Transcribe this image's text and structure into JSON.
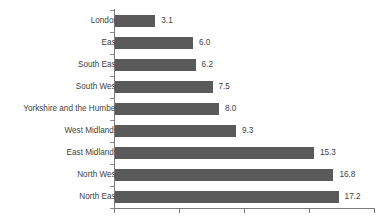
{
  "chart_data": {
    "type": "bar",
    "orientation": "horizontal",
    "title": "",
    "subtitle": "",
    "xlabel": "",
    "ylabel": "",
    "xlim": [
      0,
      20
    ],
    "grid": false,
    "legend": null,
    "x_tick_values": [
      0,
      5,
      10,
      15,
      20
    ],
    "x_tick_labels": [
      "",
      "",
      "",
      "",
      ""
    ],
    "categories": [
      "London",
      "East",
      "South East",
      "South West",
      "Yorkshire and the Humber",
      "West Midlands",
      "East Midlands",
      "North West",
      "North East"
    ],
    "values": [
      3.1,
      6.0,
      6.2,
      7.5,
      8.0,
      9.3,
      15.3,
      16.8,
      17.2
    ],
    "value_labels": [
      "3.1",
      "6.0",
      "6.2",
      "7.5",
      "8.0",
      "9.3",
      "15.3",
      "16.8",
      "17.2"
    ],
    "bar_color": "#5a5a5a",
    "axis_color": "#7a7a7a",
    "text_color": "#3f3f3f",
    "background_color": "#ffffff"
  }
}
